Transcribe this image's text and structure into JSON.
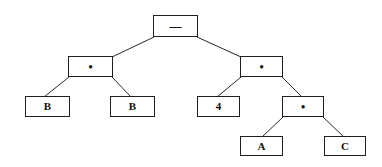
{
  "diagram": {
    "type": "expression-tree",
    "colors": {
      "background": "#ffffff",
      "border": "#1e1e1e",
      "edge": "#2a2a2a",
      "text": "#111111"
    },
    "nodes": [
      {
        "id": "root",
        "label": "—",
        "kind": "operator",
        "x": 153,
        "y": 15,
        "w": 45,
        "h": 22
      },
      {
        "id": "mul_left",
        "label": "•",
        "kind": "operator",
        "x": 68,
        "y": 56,
        "w": 45,
        "h": 21
      },
      {
        "id": "b1",
        "label": "B",
        "kind": "operand",
        "x": 25,
        "y": 96,
        "w": 45,
        "h": 21
      },
      {
        "id": "b2",
        "label": "B",
        "kind": "operand",
        "x": 110,
        "y": 96,
        "w": 45,
        "h": 21
      },
      {
        "id": "mul_right",
        "label": "•",
        "kind": "operator",
        "x": 240,
        "y": 56,
        "w": 43,
        "h": 21
      },
      {
        "id": "four",
        "label": "4",
        "kind": "operand",
        "x": 197,
        "y": 96,
        "w": 43,
        "h": 21
      },
      {
        "id": "mul_lower",
        "label": "•",
        "kind": "operator",
        "x": 282,
        "y": 96,
        "w": 42,
        "h": 21
      },
      {
        "id": "a",
        "label": "A",
        "kind": "operand",
        "x": 240,
        "y": 136,
        "w": 43,
        "h": 20
      },
      {
        "id": "c",
        "label": "C",
        "kind": "operand",
        "x": 324,
        "y": 136,
        "w": 42,
        "h": 20
      }
    ],
    "edges": [
      {
        "from": "root",
        "to": "mul_left",
        "x1": 154,
        "y1": 37,
        "x2": 112,
        "y2": 57
      },
      {
        "from": "root",
        "to": "mul_right",
        "x1": 197,
        "y1": 37,
        "x2": 241,
        "y2": 57
      },
      {
        "from": "mul_left",
        "to": "b1",
        "x1": 69,
        "y1": 77,
        "x2": 44,
        "y2": 97
      },
      {
        "from": "mul_left",
        "to": "b2",
        "x1": 112,
        "y1": 77,
        "x2": 131,
        "y2": 97
      },
      {
        "from": "mul_right",
        "to": "four",
        "x1": 241,
        "y1": 77,
        "x2": 217,
        "y2": 97
      },
      {
        "from": "mul_right",
        "to": "mul_lower",
        "x1": 282,
        "y1": 77,
        "x2": 302,
        "y2": 97
      },
      {
        "from": "mul_lower",
        "to": "a",
        "x1": 283,
        "y1": 117,
        "x2": 262,
        "y2": 137
      },
      {
        "from": "mul_lower",
        "to": "c",
        "x1": 323,
        "y1": 117,
        "x2": 344,
        "y2": 137
      }
    ]
  },
  "labels": {
    "root": "—",
    "mul_left": "•",
    "b1": "B",
    "b2": "B",
    "mul_right": "•",
    "four": "4",
    "mul_lower": "•",
    "a": "A",
    "c": "C"
  }
}
